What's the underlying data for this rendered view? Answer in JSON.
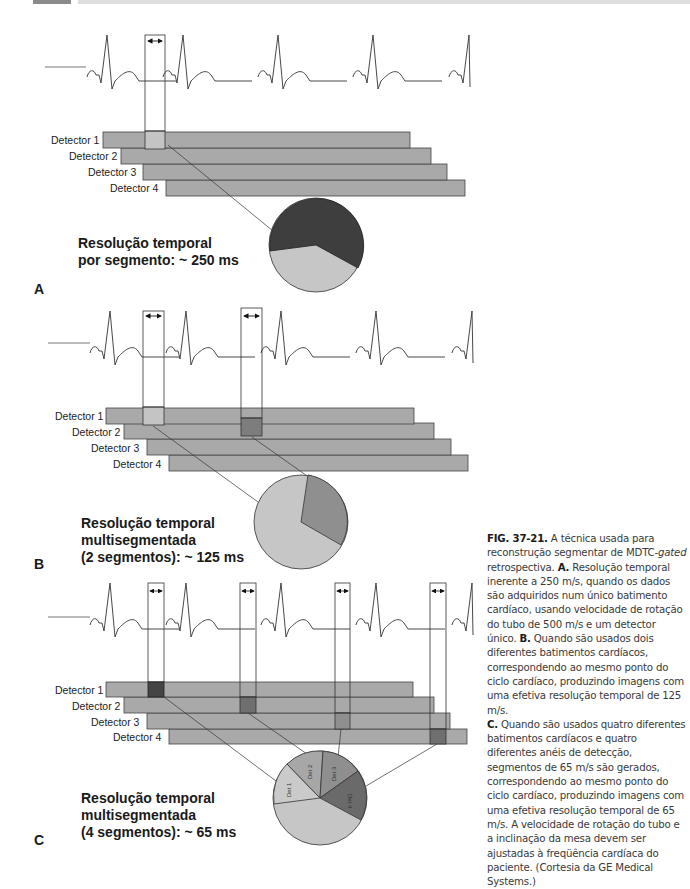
{
  "header": {
    "bar_colors": {
      "dark": "#8a8a8a",
      "light": "#dedede"
    }
  },
  "panels": [
    {
      "letter": "A",
      "detectors": [
        "Detector 1",
        "Detector 2",
        "Detector 3",
        "Detector 4"
      ],
      "resolution_text": "Resolução temporal\npor segmento: ~ 250 ms",
      "segments": 1,
      "pie_labels": []
    },
    {
      "letter": "B",
      "detectors": [
        "Detector 1",
        "Detector 2",
        "Detector 3",
        "Detector 4"
      ],
      "resolution_text": "Resolução temporal\nmultisegmentada\n(2 segmentos): ~ 125 ms",
      "segments": 2,
      "pie_labels": []
    },
    {
      "letter": "C",
      "detectors": [
        "Detector 1",
        "Detector 2",
        "Detector 3",
        "Detector 4"
      ],
      "resolution_text": "Resolução temporal\nmultisegmentada\n(4 segmentos): ~ 65 ms",
      "segments": 4,
      "pie_labels": [
        "Det 1",
        "Det 2",
        "Det 3",
        "Det 4"
      ]
    }
  ],
  "colors": {
    "detector_bar": "#a9a9a9",
    "segment_light": "#c4c4c4",
    "segment_medium": "#8f8f8f",
    "segment_dark": "#444444",
    "pie_remainder": "#c6c6c6"
  },
  "caption": {
    "fig_label": "FIG. 37-21.",
    "intro": " A técnica usada para reconstrução segmentar de MDTC-",
    "intro_italic": "gated",
    "intro_end": " retrospectiva. ",
    "a_label": "A.",
    "a_text": " Resolução temporal inerente a 250 m/s, quando os dados são adquiridos num único batimento cardíaco, usando velocidade de rotação do tubo de 500 m/s e um detector único. ",
    "b_label": "B.",
    "b_text": " Quando são usados dois diferentes batimentos cardíacos, correspondendo ao mesmo ponto do ciclo cardíaco, produzindo imagens com uma efetiva resolução temporal de 125 m/s.",
    "c_label": "C.",
    "c_text": " Quando são usados quatro diferentes batimentos cardíacos e quatro diferentes anéis de detecção, segmentos de 65 m/s são gerados, correspondendo ao mesmo ponto do ciclo cardíaco, produzindo imagens com uma efetiva resolução temporal de 65 m/s. A velocidade de rotação do tubo e a inclinação da mesa devem ser ajustadas à freqüência cardíaca do paciente. (Cortesia da GE Medical Systems.)"
  }
}
